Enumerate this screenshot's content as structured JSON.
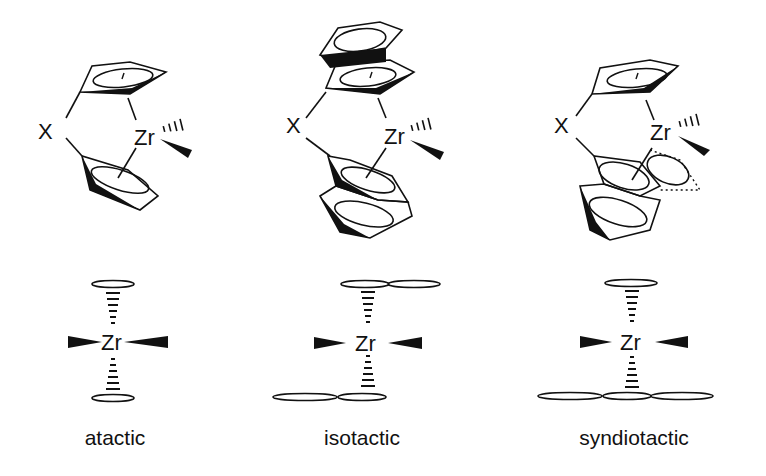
{
  "figure": {
    "type": "metallocene catalyst stereochemistry diagram",
    "panels": [
      {
        "id": "atactic",
        "caption": "atactic",
        "metal_label": "Zr",
        "bridge_label": "X",
        "ligand": "cyclopentadienyl (C2v)",
        "top_view": {
          "top_rings": 1,
          "bottom_rings": 1
        }
      },
      {
        "id": "isotactic",
        "caption": "isotactic",
        "metal_label": "Zr",
        "bridge_label": "X",
        "ligand": "indenyl (C2)",
        "top_view": {
          "top_rings": 2,
          "bottom_rings": 2
        }
      },
      {
        "id": "syndiotactic",
        "caption": "syndiotactic",
        "metal_label": "Zr",
        "bridge_label": "X",
        "ligand": "Cp / fluorenyl (Cs)",
        "top_view": {
          "top_rings": 1,
          "bottom_rings": 3
        }
      }
    ]
  }
}
